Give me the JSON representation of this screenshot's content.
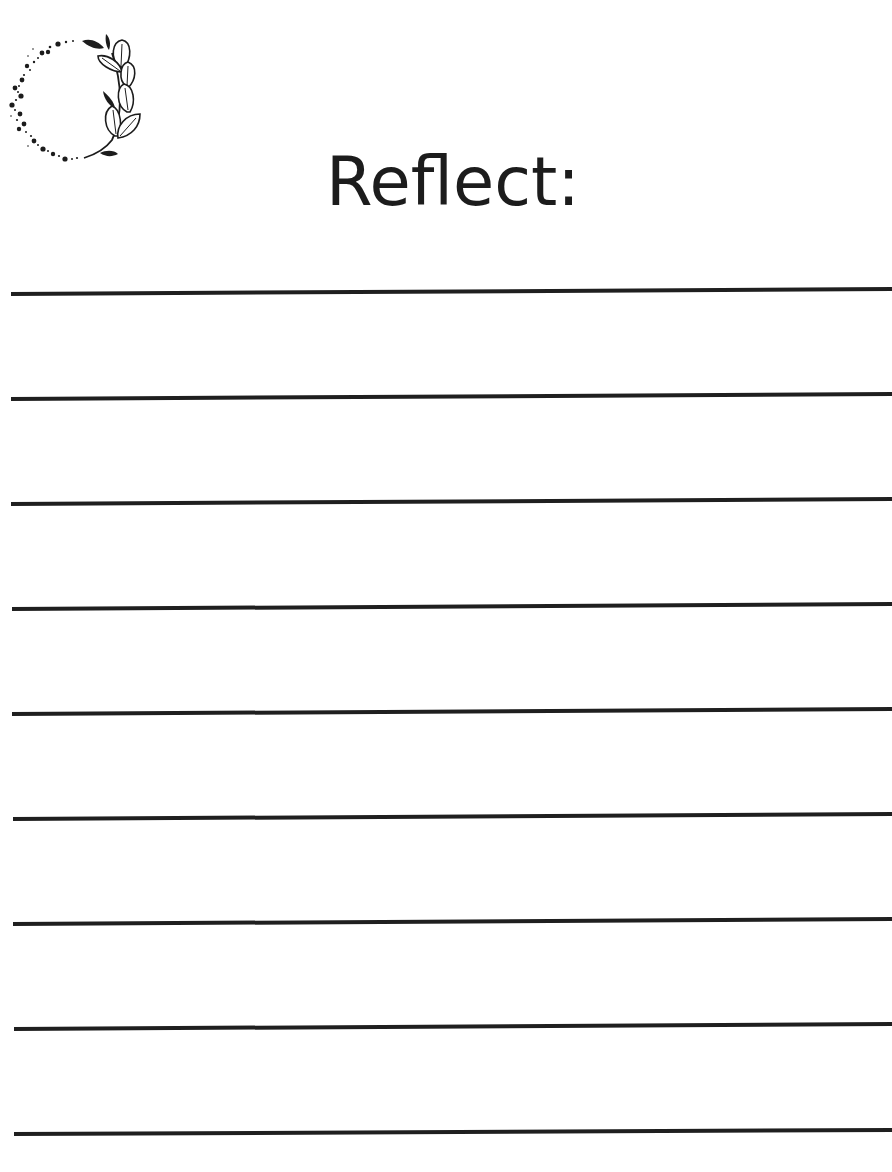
{
  "page": {
    "title": "Reflect:",
    "decoration": {
      "icon": "leaf-wreath-icon",
      "description": "dotted circle with leafy branch on right side"
    },
    "ruled_lines": {
      "count": 9,
      "color": "#1f1f1f",
      "thickness": 4,
      "lines": [
        {
          "x1": 11,
          "y1": 294,
          "x2": 892,
          "y2": 289
        },
        {
          "x1": 11,
          "y1": 399,
          "x2": 892,
          "y2": 394
        },
        {
          "x1": 11,
          "y1": 504,
          "x2": 892,
          "y2": 499
        },
        {
          "x1": 12,
          "y1": 609,
          "x2": 892,
          "y2": 604
        },
        {
          "x1": 12,
          "y1": 714,
          "x2": 892,
          "y2": 709
        },
        {
          "x1": 13,
          "y1": 819,
          "x2": 892,
          "y2": 814
        },
        {
          "x1": 13,
          "y1": 924,
          "x2": 892,
          "y2": 919
        },
        {
          "x1": 14,
          "y1": 1029,
          "x2": 892,
          "y2": 1024
        },
        {
          "x1": 14,
          "y1": 1134,
          "x2": 892,
          "y2": 1130
        }
      ]
    },
    "colors": {
      "background": "#ffffff",
      "ink": "#1c1c1c"
    }
  }
}
